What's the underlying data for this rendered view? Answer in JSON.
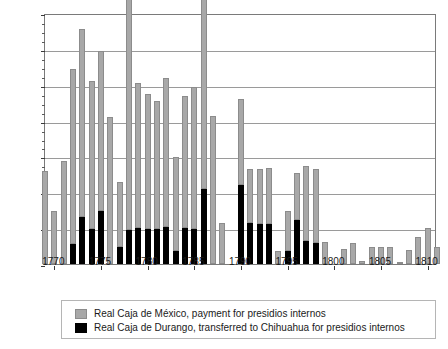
{
  "chart_data": {
    "type": "bar",
    "stacked": true,
    "title": "",
    "xlabel": "",
    "ylabel": "Pesos (thousands)",
    "ylim": [
      0,
      1400
    ],
    "ytick_values": [
      0,
      200,
      400,
      600,
      800,
      1000,
      1200,
      1400
    ],
    "ytick_labels": [
      "0",
      "200",
      "400",
      "600",
      "800",
      "1,000",
      "1,200",
      "1,400"
    ],
    "xlim": [
      1769,
      1811
    ],
    "xtick_values": [
      1770,
      1775,
      1780,
      1785,
      1790,
      1795,
      1800,
      1805,
      1810
    ],
    "xtick_labels": [
      "1770",
      "1775",
      "1780",
      "1785",
      "1790",
      "1795",
      "1800",
      "1805",
      "1810"
    ],
    "grid": "horizontal",
    "legend_position": "below",
    "series": [
      {
        "name": "Real Caja de México, payment for presidios internos",
        "color": "#a8a8a8",
        "values": [
          520,
          295,
          575,
          975,
          1050,
          825,
          895,
          820,
          360,
          1300,
          810,
          755,
          715,
          830,
          520,
          735,
          790,
          1120,
          825,
          230,
          0,
          480,
          300,
          305,
          310,
          75,
          220,
          265,
          415,
          410,
          125,
          0,
          85,
          120,
          15,
          95,
          95,
          95,
          5,
          80,
          150,
          200,
          95
        ]
      },
      {
        "name": "Real Caja de Durango, transferred to Chihuahua for presidios internos",
        "color": "#000000",
        "values": [
          0,
          0,
          0,
          110,
          260,
          195,
          295,
          0,
          95,
          190,
          200,
          195,
          195,
          205,
          75,
          200,
          195,
          420,
          0,
          0,
          0,
          440,
          230,
          225,
          225,
          0,
          75,
          245,
          130,
          120,
          0,
          0,
          0,
          0,
          0,
          0,
          0,
          0,
          0,
          0,
          0,
          0,
          0
        ]
      }
    ],
    "x": [
      1769,
      1770,
      1771,
      1772,
      1773,
      1774,
      1775,
      1776,
      1777,
      1778,
      1779,
      1780,
      1781,
      1782,
      1783,
      1784,
      1785,
      1786,
      1787,
      1788,
      1789,
      1790,
      1791,
      1792,
      1793,
      1794,
      1795,
      1796,
      1797,
      1798,
      1799,
      1800,
      1801,
      1802,
      1803,
      1804,
      1805,
      1806,
      1807,
      1808,
      1809,
      1810,
      1811
    ]
  },
  "legend": {
    "items": [
      {
        "label": "Real Caja de México, payment for presidios internos",
        "swatch": "mexico-swatch"
      },
      {
        "label": "Real Caja de Durango, transferred to Chihuahua for presidios internos",
        "swatch": "durango-swatch"
      }
    ]
  }
}
